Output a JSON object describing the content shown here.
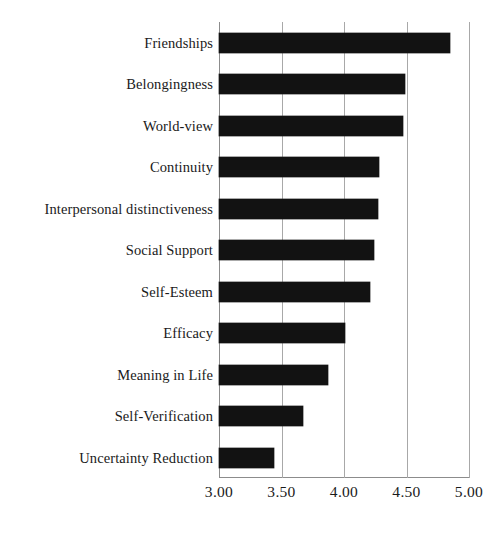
{
  "chart_data": {
    "type": "bar",
    "orientation": "horizontal",
    "title": "",
    "subtitle": "",
    "xlabel": "",
    "ylabel": "",
    "categories": [
      "Friendships",
      "Belongingness",
      "World-view",
      "Continuity",
      "Interpersonal distinctiveness",
      "Social Support",
      "Self-Esteem",
      "Efficacy",
      "Meaning in Life",
      "Self-Verification",
      "Uncertainty Reduction"
    ],
    "values": [
      4.85,
      4.49,
      4.47,
      4.28,
      4.27,
      4.24,
      4.21,
      4.01,
      3.87,
      3.67,
      3.44
    ],
    "xlim": [
      3.0,
      5.0
    ],
    "xticks": [
      3.0,
      3.5,
      4.0,
      4.5,
      5.0
    ],
    "xtick_labels": [
      "3.00",
      "3.50",
      "4.00",
      "4.50",
      "5.00"
    ],
    "grid": "vertical",
    "legend": "none",
    "bar_color": "#121212",
    "grid_color": "#a8a8a8",
    "axis_color": "#8c8c8c",
    "background_color": "#ffffff"
  }
}
